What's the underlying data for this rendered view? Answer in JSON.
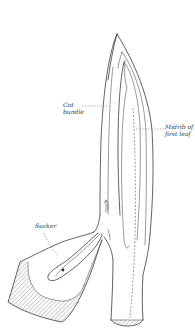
{
  "diagram": {
    "labels": {
      "cot_bundle": {
        "line1": "Cot",
        "line2": "bundle"
      },
      "midrib": {
        "line1": "Midrib of",
        "line2": "first leaf"
      },
      "sucker": {
        "line1": "Sucker"
      }
    },
    "colors": {
      "stroke": "#3a3a3a",
      "background": "#ffffff",
      "hatch": "#555555"
    }
  }
}
